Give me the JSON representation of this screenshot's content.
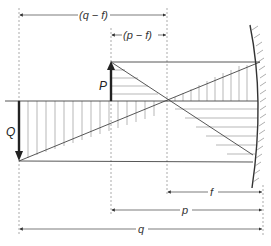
{
  "diagram": {
    "type": "concave-mirror-image-formation",
    "labels": {
      "q_minus_f": "(q − f)",
      "p_minus_f": "(p − f)",
      "object": "P",
      "image": "Q",
      "f": "f",
      "p": "p",
      "q": "q"
    },
    "colors": {
      "line": "#444444",
      "hatch": "#777777",
      "arrow": "#222222",
      "background": "#ffffff"
    }
  }
}
